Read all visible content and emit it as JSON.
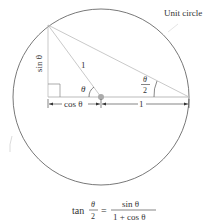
{
  "diagram": {
    "circle_label": "Unit circle",
    "labels": {
      "sin": "sin θ",
      "cos": "cos θ",
      "radius": "1",
      "theta": "θ",
      "half_theta_num": "θ",
      "half_theta_den": "2",
      "one_base": "1"
    },
    "formula": {
      "lhs_func": "tan",
      "lhs_num": "θ",
      "lhs_den": "2",
      "equals": "=",
      "rhs_num": "sin θ",
      "rhs_den": "1 + cos θ"
    },
    "colors": {
      "circle": "#555555",
      "lines": "#bbbbbb",
      "center_dot": "#aaaaaa",
      "text": "#333333"
    }
  }
}
